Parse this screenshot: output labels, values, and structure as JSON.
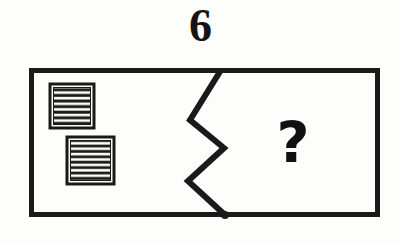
{
  "item": {
    "number": "6",
    "type": "visual-analogy-puzzle"
  },
  "figure": {
    "frame": {
      "shape": "rectangle",
      "x": 29,
      "y": 68,
      "width": 351,
      "height": 149,
      "stroke_color": "#1a1a1a",
      "stroke_width": 5,
      "fill_color": "#fdfdfb"
    },
    "divider": {
      "shape": "zigzag-line",
      "name": "zigzag-divider",
      "stroke_color": "#1a1a1a",
      "stroke_width": 6,
      "points": [
        [
          221,
          70
        ],
        [
          190,
          120
        ],
        [
          224,
          148
        ],
        [
          188,
          181
        ],
        [
          225,
          215
        ]
      ],
      "end_node": {
        "x": 225,
        "y": 215,
        "radius": 4,
        "color": "#1a1a1a"
      }
    },
    "left_panel": {
      "name": "left-panel",
      "shapes": [
        {
          "name": "striped-square-upper",
          "x": 50,
          "y": 84,
          "width": 44,
          "height": 44,
          "border_color": "#1a1a1a",
          "border_width": 3,
          "stripe_color": "#1a1a1a",
          "gap_color": "#fdfdfb",
          "stripe_count": 7,
          "stripe_orientation": "horizontal"
        },
        {
          "name": "striped-square-lower",
          "x": 67,
          "y": 137,
          "width": 47,
          "height": 47,
          "border_color": "#1a1a1a",
          "border_width": 3,
          "stripe_color": "#1a1a1a",
          "gap_color": "#fdfdfb",
          "stripe_count": 8,
          "stripe_orientation": "horizontal"
        }
      ]
    },
    "right_panel": {
      "name": "right-panel",
      "question_mark": "?"
    }
  },
  "colors": {
    "ink": "#1a1a1a",
    "paper": "#fdfdfb"
  }
}
